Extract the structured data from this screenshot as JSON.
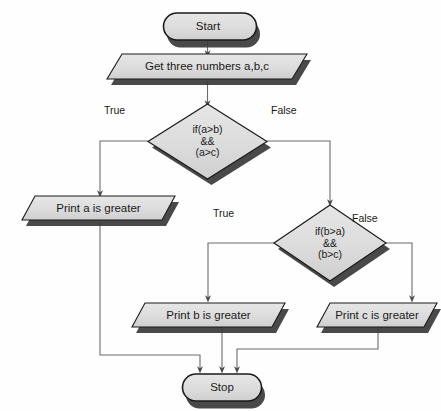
{
  "diagram": {
    "style": {
      "node_fill": "#d7d7d7",
      "node_fill_light": "#e2e2e2",
      "node_stroke": "#1b1b1b",
      "shadow_color": "#2b2b2b",
      "connector_color": "#5a5a5a",
      "text_color": "#1b1b1b",
      "background": "#fefefe"
    },
    "nodes": [
      {
        "id": "start",
        "type": "terminal",
        "label": "Start"
      },
      {
        "id": "input",
        "type": "input-output",
        "label": "Get three numbers a,b,c"
      },
      {
        "id": "decision1",
        "type": "decision",
        "label": "if(a>b)\n&&\n(a>c)"
      },
      {
        "id": "print_a",
        "type": "input-output",
        "label": "Print a is greater"
      },
      {
        "id": "decision2",
        "type": "decision",
        "label": "if(b>a)\n&&\n(b>c)"
      },
      {
        "id": "print_b",
        "type": "input-output",
        "label": "Print b is greater"
      },
      {
        "id": "print_c",
        "type": "input-output",
        "label": "Print c is greater"
      },
      {
        "id": "stop",
        "type": "terminal",
        "label": "Stop"
      }
    ],
    "edge_labels": [
      {
        "id": "d1-true",
        "label": "True"
      },
      {
        "id": "d1-false",
        "label": "False"
      },
      {
        "id": "d2-true",
        "label": "True"
      },
      {
        "id": "d2-false",
        "label": "False"
      }
    ]
  }
}
